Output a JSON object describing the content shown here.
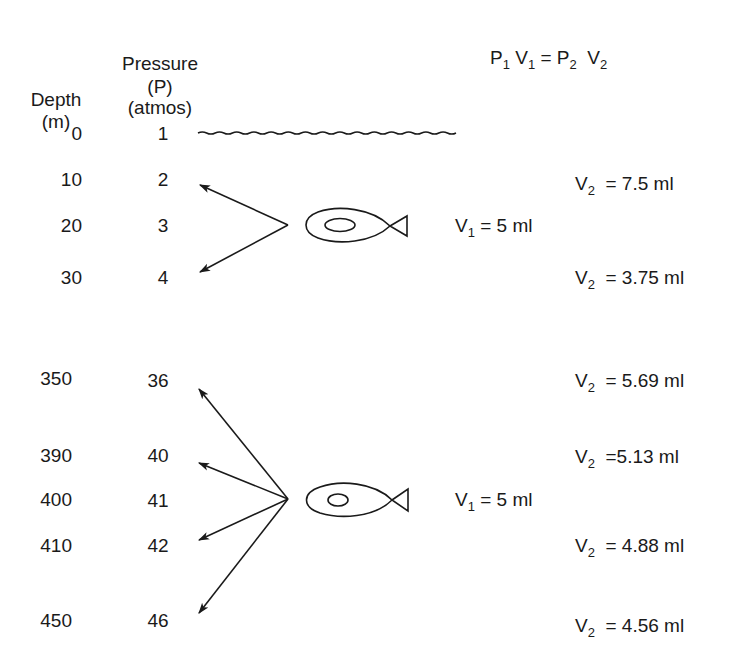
{
  "header": {
    "depth_label": "Depth",
    "depth_unit": "(m)",
    "pressure_label": "Pressure",
    "pressure_symbol": "(P)",
    "pressure_unit": "(atmos)"
  },
  "formula": {
    "p1": "P",
    "p1_sub": "1",
    "v1": "V",
    "v1_sub": "1",
    "eq": "=",
    "p2": "P",
    "p2_sub": "2",
    "v2": "V",
    "v2_sub": "2"
  },
  "top_section": {
    "rows": [
      {
        "depth": "0",
        "pressure": "1"
      },
      {
        "depth": "10",
        "pressure": "2"
      },
      {
        "depth": "20",
        "pressure": "3"
      },
      {
        "depth": "30",
        "pressure": "4"
      }
    ],
    "v1": {
      "symbol": "V",
      "sub": "1",
      "text": " = 5 ml"
    },
    "v2": [
      {
        "symbol": "V",
        "sub": "2",
        "text": " = 7.5 ml"
      },
      {
        "symbol": "V",
        "sub": "2",
        "text": " = 3.75 ml"
      }
    ]
  },
  "bottom_section": {
    "rows": [
      {
        "depth": "350",
        "pressure": "36"
      },
      {
        "depth": "390",
        "pressure": "40"
      },
      {
        "depth": "400",
        "pressure": "41"
      },
      {
        "depth": "410",
        "pressure": "42"
      },
      {
        "depth": "450",
        "pressure": "46"
      }
    ],
    "v1": {
      "symbol": "V",
      "sub": "1",
      "text": " = 5 ml"
    },
    "v2": [
      {
        "symbol": "V",
        "sub": "2",
        "text": " = 5.69 ml"
      },
      {
        "symbol": "V",
        "sub": "2",
        "text": " =5.13 ml"
      },
      {
        "symbol": "V",
        "sub": "2",
        "text": " = 4.88 ml"
      },
      {
        "symbol": "V",
        "sub": "2",
        "text": " = 4.56 ml"
      }
    ]
  },
  "icons": {
    "surface": "water-surface-wave",
    "fish": "fish-swim-bladder",
    "arrows": "depth-change-arrows"
  },
  "colors": {
    "ink": "#1a1a1a",
    "background": "#ffffff"
  }
}
